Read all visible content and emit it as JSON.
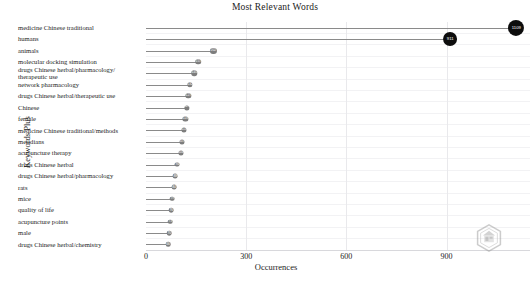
{
  "chart_data": {
    "type": "bar",
    "subtype": "lollipop-horizontal",
    "title": "Most Relevant Words",
    "xlabel": "Occurrences",
    "ylabel": "Keywords Plus",
    "xlim": [
      0,
      1150
    ],
    "xticks": [
      0,
      300,
      600,
      900
    ],
    "xtick_labels": [
      "0",
      "300",
      "600",
      "900"
    ],
    "grid": true,
    "legend": null,
    "categories": [
      "medicine Chinese traditional",
      "humans",
      "animals",
      "molecular docking simulation",
      "drugs Chinese herbal/pharmacology/\ntherapeutic use",
      "network pharmacology",
      "drugs Chinese herbal/therapeutic use",
      "Chinese",
      "female",
      "medicine Chinese traditional/meihods",
      "meridians",
      "acupuncture therapy",
      "drugs Chinese herbal",
      "drugs Chinese herbal/pharmacology",
      "rats",
      "mice",
      "quality of life",
      "acupuncture points",
      "male",
      "drugs Chinese herbal/chemistry"
    ],
    "values": [
      1109,
      911,
      202,
      157,
      145,
      132,
      127,
      123,
      118,
      114,
      107,
      104,
      94,
      88,
      84,
      79,
      76,
      73,
      70,
      66
    ]
  },
  "watermark": {
    "name": "hexagon-logo-watermark"
  }
}
